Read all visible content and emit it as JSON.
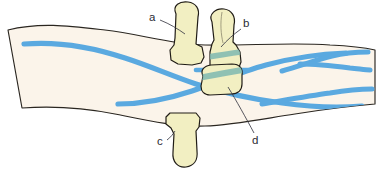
{
  "figure": {
    "background_color": "#ffffff",
    "limb_fill": "#fbf4ea",
    "limb_outline_color": "#2a2620",
    "bone_fill": "#f2efc2",
    "bone_outline_color": "#201c16",
    "vessel_color": "#5aa9e0",
    "vessel_overlay_color": "#7fb9b0",
    "label_color": "#2b2b33",
    "leader_color": "#3a3a44"
  },
  "labels": [
    {
      "id": "a",
      "text": "a",
      "x": 152,
      "y": 17,
      "target_x": 186,
      "target_y": 34
    },
    {
      "id": "b",
      "text": "b",
      "x": 243,
      "y": 26,
      "target_x": 222,
      "target_y": 46
    },
    {
      "id": "c",
      "text": "c",
      "x": 160,
      "y": 141,
      "target_x": 175,
      "target_y": 132
    },
    {
      "id": "d",
      "text": "d",
      "x": 255,
      "y": 138,
      "target_x": 228,
      "target_y": 88
    }
  ],
  "structures": [
    {
      "id": "a",
      "name": "upper-bone-segment-a",
      "description": "Pale yellow finger-like bone projecting upward, left of center"
    },
    {
      "id": "b",
      "name": "upper-bone-segment-b",
      "description": "Pale yellow finger-like bone projecting upward, right of a, with teal vessel band crossing behind"
    },
    {
      "id": "c",
      "name": "lower-bone-segment-c",
      "description": "Pale yellow finger-like bone projecting downward below the limb"
    },
    {
      "id": "d",
      "name": "bone-fragment-d",
      "description": "Small rounded bone segment with teal vessel band, centered in the limb"
    }
  ],
  "vessels": [
    {
      "id": "v1",
      "name": "upper-left-vessel",
      "description": "Blue vessel entering upper left, sweeping right and down to the crossing"
    },
    {
      "id": "v2",
      "name": "lower-left-vessel",
      "description": "Blue vessel entering lower left, sweeping right and up to the crossing"
    },
    {
      "id": "v3",
      "name": "upper-right-branch",
      "description": "Blue vessel branching into a Y on the right side, upper"
    },
    {
      "id": "v4",
      "name": "lower-right-vessel",
      "description": "Blue vessel exiting at lower right"
    }
  ]
}
